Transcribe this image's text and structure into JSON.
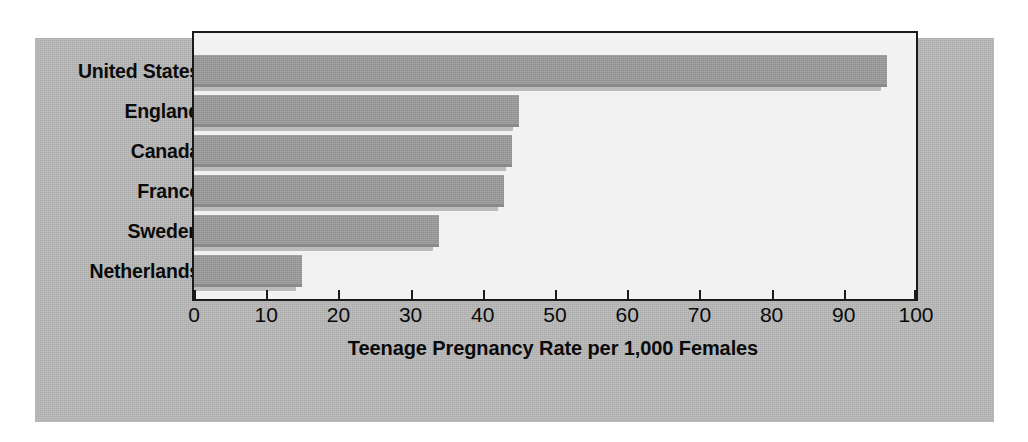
{
  "chart_data": {
    "type": "bar",
    "orientation": "horizontal",
    "title": "",
    "xlabel": "Teenage Pregnancy Rate per 1,000 Females",
    "ylabel": "",
    "categories": [
      "United States",
      "England",
      "Canada",
      "France",
      "Sweden",
      "Netherlands"
    ],
    "values": [
      96,
      45,
      44,
      43,
      34,
      15
    ],
    "series": [
      {
        "name": "Teenage Pregnancy Rate per 1,000 Females",
        "values": [
          96,
          45,
          44,
          43,
          34,
          15
        ]
      }
    ],
    "xlim": [
      0,
      100
    ],
    "xticks": [
      0,
      10,
      20,
      30,
      40,
      50,
      60,
      70,
      80,
      90,
      100
    ],
    "xtick_labels": [
      "0",
      "10",
      "20",
      "30",
      "40",
      "50",
      "60",
      "70",
      "80",
      "90",
      "100"
    ],
    "grid": false,
    "legend": false,
    "legend_position": "none",
    "colors": {
      "bar_fill": "#9d9d9d",
      "bar_shadow": "#8a8a8a",
      "plot_background": "#f2f2f2",
      "panel_background": "#b9b9b9",
      "axis_line": "#1a1a1a",
      "text": "#0a0a0a"
    }
  }
}
